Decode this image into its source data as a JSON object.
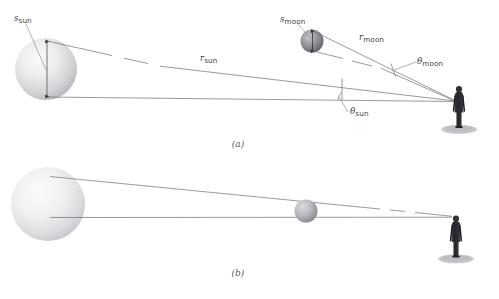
{
  "figure": {
    "background_color": "#ffffff",
    "line_color": "#6f6f78",
    "label_color": "#3d3d44",
    "panels": [
      {
        "id": "a",
        "caption": "(a)",
        "description": "Separate sight lines to the Sun and to the Moon, showing arc lengths, distances and subtended angles",
        "labels": [
          {
            "name": "s-sun",
            "symbol": "s",
            "subscript": "sun",
            "meaning": "diameter (arc length) of the Sun"
          },
          {
            "name": "r-sun",
            "symbol": "r",
            "subscript": "sun",
            "meaning": "distance from observer to the Sun"
          },
          {
            "name": "theta-sun",
            "symbol": "θ",
            "subscript": "sun",
            "meaning": "angle subtended by the Sun"
          },
          {
            "name": "s-moon",
            "symbol": "s",
            "subscript": "moon",
            "meaning": "diameter (arc length) of the Moon"
          },
          {
            "name": "r-moon",
            "symbol": "r",
            "subscript": "moon",
            "meaning": "distance from observer to the Moon"
          },
          {
            "name": "theta-moon",
            "symbol": "θ",
            "subscript": "moon",
            "meaning": "angle subtended by the Moon"
          }
        ],
        "bodies": [
          {
            "name": "sun",
            "color_light": "#f2f2f2",
            "color_dark": "#b9b9bd",
            "radius_px": 31
          },
          {
            "name": "moon",
            "color_light": "#b5b5ba",
            "color_dark": "#6e6e75",
            "radius_px": 12
          }
        ],
        "observer": {
          "name": "observer",
          "color": "#2b2b30"
        }
      },
      {
        "id": "b",
        "caption": "(b)",
        "description": "Moon aligned on the observer's sight line to the Sun, filling the same angular size — a solar eclipse",
        "labels": [],
        "bodies": [
          {
            "name": "sun",
            "color_light": "#f4f4f4",
            "color_dark": "#c8c8cc",
            "radius_px": 37
          },
          {
            "name": "moon",
            "color_light": "#c4c4c8",
            "color_dark": "#8c8c93",
            "radius_px": 12
          }
        ],
        "observer": {
          "name": "observer",
          "color": "#2b2b30"
        }
      }
    ]
  }
}
